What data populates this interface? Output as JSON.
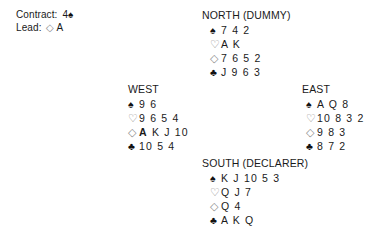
{
  "info": {
    "contract_label": "Contract:",
    "contract_level": "4",
    "contract_suit": "♠",
    "contract_suit_name": "spade",
    "lead_label": "Lead:",
    "lead_suit": "◇",
    "lead_suit_name": "diamond",
    "lead_card": "A"
  },
  "suits": {
    "spade": "♠",
    "heart": "♡",
    "diamond": "◇",
    "club": "♣"
  },
  "hands": {
    "north": {
      "title": "NORTH (DUMMY)",
      "spades": "7 4 2",
      "hearts": "A K",
      "diamonds": "7 6 5 2",
      "clubs": "J 9 6 3"
    },
    "west": {
      "title": "WEST",
      "spades": "9 6",
      "hearts": "9 6 5 4",
      "diamonds_bold": "A",
      "diamonds_rest": "K J 10",
      "clubs": "10 5 4"
    },
    "east": {
      "title": "EAST",
      "spades": "A Q 8",
      "hearts": "10 8 3 2",
      "diamonds": "9 8 3",
      "clubs": "8 7 2"
    },
    "south": {
      "title": "SOUTH (DECLARER)",
      "spades": "K J 10 5 3",
      "hearts": "Q J 7",
      "diamonds": "Q 4",
      "clubs": "A K Q"
    }
  },
  "colors": {
    "text": "#1a1a1a",
    "black_suit": "#111111",
    "red_suit_outline": "#8a8a8a",
    "background": "#ffffff"
  }
}
